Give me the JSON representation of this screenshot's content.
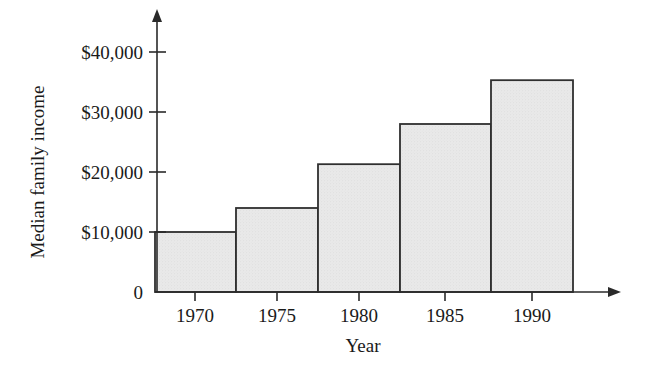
{
  "chart_data": {
    "type": "bar",
    "title": "",
    "xlabel": "Year",
    "ylabel": "Median family income",
    "categories": [
      "1970",
      "1975",
      "1980",
      "1985",
      "1990"
    ],
    "values": [
      10000,
      14000,
      21300,
      28000,
      35300
    ],
    "value_labels": [
      "$10,000",
      "$14,000",
      "$21,300",
      "$28,000",
      "$35,300"
    ],
    "ylim": [
      0,
      40000
    ],
    "xlim_note": "bars span 5-year intervals, ticks centered on each bar",
    "yticks": [
      0,
      10000,
      20000,
      30000,
      40000
    ],
    "ytick_labels": [
      "0",
      "$10,000",
      "$20,000",
      "$30,000",
      "$40,000"
    ],
    "xtick_labels": [
      "1970",
      "1975",
      "1980",
      "1985",
      "1990"
    ],
    "grid": false,
    "legend": null,
    "legend_position": "none",
    "bar_fill_color": "#e8e8e8",
    "bar_edge_color": "#2f2f2f",
    "axis_color": "#2a2a2a",
    "axis_arrows": true
  },
  "axes": {
    "y_title": "Median family income",
    "x_title": "Year",
    "y_ticks": [
      {
        "label": "$40,000",
        "value": 40000
      },
      {
        "label": "$30,000",
        "value": 30000
      },
      {
        "label": "$20,000",
        "value": 20000
      },
      {
        "label": "$10,000",
        "value": 10000
      },
      {
        "label": "0",
        "value": 0
      }
    ],
    "x_ticks": [
      {
        "label": "1970"
      },
      {
        "label": "1975"
      },
      {
        "label": "1980"
      },
      {
        "label": "1985"
      },
      {
        "label": "1990"
      }
    ]
  }
}
